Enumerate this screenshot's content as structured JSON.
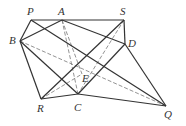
{
  "diagram": {
    "points": {
      "P": {
        "label": "P",
        "x": 31,
        "y": 20,
        "lx": 27,
        "ly": 6
      },
      "A": {
        "label": "A",
        "x": 62,
        "y": 20,
        "lx": 58,
        "ly": 6
      },
      "S": {
        "label": "S",
        "x": 124,
        "y": 20,
        "lx": 120,
        "ly": 6
      },
      "B": {
        "label": "B",
        "x": 20,
        "y": 41,
        "lx": 9,
        "ly": 35
      },
      "D": {
        "label": "D",
        "x": 125,
        "y": 44,
        "lx": 128,
        "ly": 38
      },
      "E": {
        "label": "E",
        "x": 82,
        "y": 74,
        "lx": 82,
        "ly": 73
      },
      "R": {
        "label": "R",
        "x": 41,
        "y": 99,
        "lx": 37,
        "ly": 103
      },
      "C": {
        "label": "C",
        "x": 78,
        "y": 94,
        "lx": 74,
        "ly": 102
      },
      "Q": {
        "label": "Q",
        "x": 166,
        "y": 106,
        "lx": 164,
        "ly": 109
      }
    },
    "solid_segments": [
      [
        "P",
        "S"
      ],
      [
        "P",
        "B"
      ],
      [
        "B",
        "A"
      ],
      [
        "A",
        "D"
      ],
      [
        "S",
        "D"
      ],
      [
        "P",
        "Q"
      ],
      [
        "B",
        "R"
      ],
      [
        "B",
        "C"
      ],
      [
        "R",
        "S"
      ],
      [
        "C",
        "D"
      ],
      [
        "R",
        "C"
      ],
      [
        "C",
        "Q"
      ],
      [
        "D",
        "Q"
      ]
    ],
    "dashed_segments": [
      [
        "B",
        "Q"
      ],
      [
        "A",
        "C"
      ],
      [
        "A",
        "E"
      ],
      [
        "S",
        "C"
      ],
      [
        "R",
        "E"
      ]
    ],
    "stroke_color": "#333333",
    "dash_color": "#777777"
  }
}
